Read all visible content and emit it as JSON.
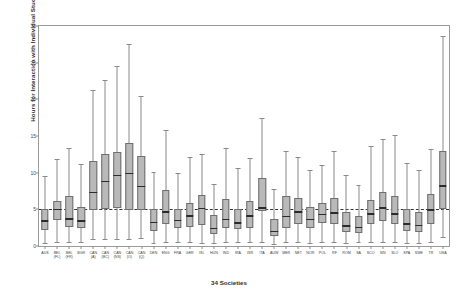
{
  "chart_data": {
    "type": "box",
    "title": "",
    "xlabel": "34 Societies",
    "ylabel": "Hours for Interaction with Individual Students",
    "ylim": [
      0,
      30
    ],
    "yticks": [
      0,
      5,
      10,
      15,
      20,
      25,
      30
    ],
    "grid": false,
    "legend": "none",
    "reference_line": {
      "value": 5,
      "style": "dashed",
      "color": "#333333"
    },
    "box_fill_color": "#b9b9b9",
    "box_edge_color": "#6f6f6f",
    "median_color": "#2b2b2b",
    "categories": [
      "AUS",
      "BEL (FL)",
      "BEL (FR)",
      "BGR",
      "CAN (AB)",
      "CAN (BC)",
      "CAN (NS)",
      "CAN (ON)",
      "CAN (QC)",
      "DNK",
      "ENG",
      "FRA",
      "GER",
      "ISL",
      "HUN",
      "IND",
      "IRA",
      "ISR",
      "ITA",
      "AUW",
      "MER",
      "NET",
      "NOR",
      "POL",
      "RF",
      "ROM",
      "SA",
      "SCO",
      "SIN",
      "SLO",
      "SPA",
      "SWE",
      "TR",
      "USA"
    ],
    "boxes": [
      {
        "label": "AUS",
        "whisker_low": 0.4,
        "q1": 2.2,
        "median": 3.4,
        "q3": 5.1,
        "whisker_high": 9.6
      },
      {
        "label": "BEL (FL)",
        "whisker_low": 0.6,
        "q1": 3.6,
        "median": 5.0,
        "q3": 6.2,
        "whisker_high": 11.8
      },
      {
        "label": "BEL (FR)",
        "whisker_low": 0.5,
        "q1": 2.6,
        "median": 3.7,
        "q3": 6.8,
        "whisker_high": 13.4
      },
      {
        "label": "BGR",
        "whisker_low": 0.5,
        "q1": 2.4,
        "median": 3.4,
        "q3": 5.3,
        "whisker_high": 11.2
      },
      {
        "label": "CAN (AB)",
        "whisker_low": 1.0,
        "q1": 4.9,
        "median": 7.3,
        "q3": 11.6,
        "whisker_high": 21.3
      },
      {
        "label": "CAN (BC)",
        "whisker_low": 1.0,
        "q1": 5.1,
        "median": 8.8,
        "q3": 12.5,
        "whisker_high": 22.6
      },
      {
        "label": "CAN (NS)",
        "whisker_low": 1.0,
        "q1": 5.2,
        "median": 9.6,
        "q3": 12.8,
        "whisker_high": 24.5
      },
      {
        "label": "CAN (ON)",
        "whisker_low": 1.0,
        "q1": 4.9,
        "median": 9.9,
        "q3": 14.1,
        "whisker_high": 27.5
      },
      {
        "label": "CAN (QC)",
        "whisker_low": 1.1,
        "q1": 4.9,
        "median": 8.1,
        "q3": 12.3,
        "whisker_high": 20.4
      },
      {
        "label": "DNK",
        "whisker_low": 0.4,
        "q1": 2.0,
        "median": 3.2,
        "q3": 5.0,
        "whisker_high": 10.1
      },
      {
        "label": "ENG",
        "whisker_low": 0.5,
        "q1": 3.0,
        "median": 4.6,
        "q3": 7.6,
        "whisker_high": 15.8
      },
      {
        "label": "FRA",
        "whisker_low": 0.5,
        "q1": 2.5,
        "median": 3.5,
        "q3": 5.1,
        "whisker_high": 9.9
      },
      {
        "label": "GER",
        "whisker_low": 0.5,
        "q1": 2.6,
        "median": 4.1,
        "q3": 5.9,
        "whisker_high": 12.2
      },
      {
        "label": "ISL",
        "whisker_low": 0.4,
        "q1": 2.8,
        "median": 5.1,
        "q3": 7.0,
        "whisker_high": 12.6
      },
      {
        "label": "HUN",
        "whisker_low": 0.4,
        "q1": 1.7,
        "median": 2.4,
        "q3": 4.2,
        "whisker_high": 8.5
      },
      {
        "label": "IND",
        "whisker_low": 0.5,
        "q1": 2.5,
        "median": 3.6,
        "q3": 6.4,
        "whisker_high": 13.4
      },
      {
        "label": "IRA",
        "whisker_low": 0.5,
        "q1": 2.3,
        "median": 3.1,
        "q3": 5.0,
        "whisker_high": 10.6
      },
      {
        "label": "ISR",
        "whisker_low": 0.5,
        "q1": 2.5,
        "median": 4.1,
        "q3": 6.1,
        "whisker_high": 12.0
      },
      {
        "label": "ITA",
        "whisker_low": 0.6,
        "q1": 4.8,
        "median": 5.2,
        "q3": 9.3,
        "whisker_high": 17.5
      },
      {
        "label": "AUW",
        "whisker_low": 0.3,
        "q1": 1.3,
        "median": 2.0,
        "q3": 3.7,
        "whisker_high": 7.8
      },
      {
        "label": "MER",
        "whisker_low": 0.5,
        "q1": 2.5,
        "median": 4.0,
        "q3": 6.8,
        "whisker_high": 12.9
      },
      {
        "label": "NET",
        "whisker_low": 0.5,
        "q1": 3.0,
        "median": 4.6,
        "q3": 6.5,
        "whisker_high": 12.1
      },
      {
        "label": "NOR",
        "whisker_low": 0.4,
        "q1": 2.4,
        "median": 3.6,
        "q3": 5.3,
        "whisker_high": 10.3
      },
      {
        "label": "POL",
        "whisker_low": 0.5,
        "q1": 3.1,
        "median": 4.3,
        "q3": 5.8,
        "whisker_high": 11.0
      },
      {
        "label": "RF",
        "whisker_low": 0.5,
        "q1": 3.0,
        "median": 4.5,
        "q3": 6.6,
        "whisker_high": 12.9
      },
      {
        "label": "ROM",
        "whisker_low": 0.4,
        "q1": 1.9,
        "median": 2.7,
        "q3": 4.6,
        "whisker_high": 9.7
      },
      {
        "label": "SA",
        "whisker_low": 0.5,
        "q1": 1.8,
        "median": 2.5,
        "q3": 4.1,
        "whisker_high": 8.3
      },
      {
        "label": "SCO",
        "whisker_low": 0.5,
        "q1": 3.0,
        "median": 4.4,
        "q3": 6.3,
        "whisker_high": 13.7
      },
      {
        "label": "SIN",
        "whisker_low": 0.6,
        "q1": 3.4,
        "median": 5.2,
        "q3": 7.4,
        "whisker_high": 14.6
      },
      {
        "label": "SLO",
        "whisker_low": 0.5,
        "q1": 3.0,
        "median": 4.4,
        "q3": 6.8,
        "whisker_high": 15.1
      },
      {
        "label": "SPA",
        "whisker_low": 0.4,
        "q1": 2.1,
        "median": 3.0,
        "q3": 5.1,
        "whisker_high": 11.3
      },
      {
        "label": "SWE",
        "whisker_low": 0.4,
        "q1": 1.9,
        "median": 2.8,
        "q3": 4.6,
        "whisker_high": 10.4
      },
      {
        "label": "TR",
        "whisker_low": 0.5,
        "q1": 3.0,
        "median": 4.9,
        "q3": 7.1,
        "whisker_high": 13.2
      },
      {
        "label": "USA",
        "whisker_low": 1.2,
        "q1": 5.1,
        "median": 8.2,
        "q3": 12.9,
        "whisker_high": 28.6
      }
    ]
  },
  "axis": {
    "y_title": "Hours for Interaction with Individual Students",
    "x_title": "34 Societies"
  },
  "xtick_labels": [
    {
      "line1": "AUS",
      "line2": ""
    },
    {
      "line1": "BEL",
      "line2": "(FL)"
    },
    {
      "line1": "BEL",
      "line2": "(FR)"
    },
    {
      "line1": "BGR",
      "line2": ""
    },
    {
      "line1": "CAN",
      "line2": "(A)"
    },
    {
      "line1": "CAN",
      "line2": "(BC)"
    },
    {
      "line1": "CAN",
      "line2": "(NS)"
    },
    {
      "line1": "CAN",
      "line2": "(O)"
    },
    {
      "line1": "CAN",
      "line2": "(Q)"
    },
    {
      "line1": "DEN",
      "line2": ""
    },
    {
      "line1": "ENG",
      "line2": ""
    },
    {
      "line1": "FRA",
      "line2": ""
    },
    {
      "line1": "GER",
      "line2": ""
    },
    {
      "line1": "ISL",
      "line2": ""
    },
    {
      "line1": "HUN",
      "line2": ""
    },
    {
      "line1": "IND",
      "line2": ""
    },
    {
      "line1": "IRA",
      "line2": ""
    },
    {
      "line1": "ISR",
      "line2": ""
    },
    {
      "line1": "ITA",
      "line2": ""
    },
    {
      "line1": "AUW",
      "line2": ""
    },
    {
      "line1": "MER",
      "line2": ""
    },
    {
      "line1": "NET",
      "line2": ""
    },
    {
      "line1": "NOR",
      "line2": ""
    },
    {
      "line1": "POL",
      "line2": ""
    },
    {
      "line1": "RF",
      "line2": ""
    },
    {
      "line1": "ROM",
      "line2": ""
    },
    {
      "line1": "SA",
      "line2": ""
    },
    {
      "line1": "SCO",
      "line2": ""
    },
    {
      "line1": "SIN",
      "line2": ""
    },
    {
      "line1": "SLO",
      "line2": ""
    },
    {
      "line1": "SPA",
      "line2": ""
    },
    {
      "line1": "SWE",
      "line2": ""
    },
    {
      "line1": "TR",
      "line2": ""
    },
    {
      "line1": "USA",
      "line2": ""
    }
  ]
}
